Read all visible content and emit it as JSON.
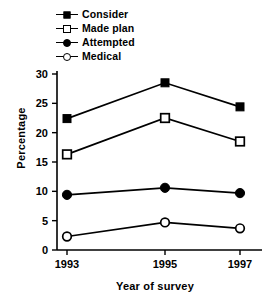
{
  "chart_data": {
    "type": "line",
    "title": "",
    "xlabel": "Year of survey",
    "ylabel": "Percentage",
    "categories": [
      "1993",
      "1995",
      "1997"
    ],
    "x": [
      1993,
      1995,
      1997
    ],
    "xlim": [
      1992.3,
      1997.7
    ],
    "ylim": [
      0,
      30
    ],
    "yticks": [
      0,
      5,
      10,
      15,
      20,
      25,
      30
    ],
    "ytick_labels": [
      "0",
      "5",
      "10",
      "15",
      "20",
      "25",
      "30"
    ],
    "grid": false,
    "legend_position": "top-left",
    "series": [
      {
        "name": "Consider",
        "marker": "filled-square",
        "color": "#000000",
        "values": [
          22.4,
          28.5,
          24.4
        ]
      },
      {
        "name": "Made plan",
        "marker": "open-square",
        "color": "#000000",
        "values": [
          16.3,
          22.5,
          18.5
        ]
      },
      {
        "name": "Attempted",
        "marker": "filled-circle",
        "color": "#000000",
        "values": [
          9.4,
          10.6,
          9.7
        ]
      },
      {
        "name": "Medical",
        "marker": "open-circle",
        "color": "#000000",
        "values": [
          2.3,
          4.7,
          3.7
        ]
      }
    ]
  },
  "legend": {
    "items": [
      {
        "label": "Consider"
      },
      {
        "label": "Made plan"
      },
      {
        "label": "Attempted"
      },
      {
        "label": "Medical"
      }
    ]
  },
  "axes": {
    "y_title": "Percentage",
    "x_title": "Year of survey"
  }
}
